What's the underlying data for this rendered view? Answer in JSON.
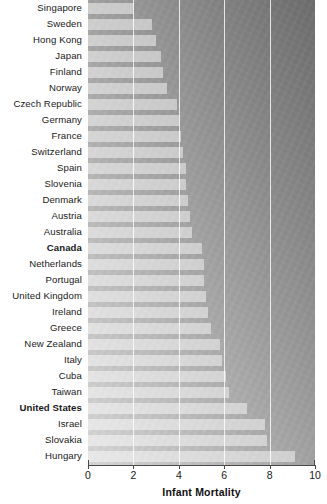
{
  "chart_data": {
    "type": "bar",
    "orientation": "horizontal",
    "title": "",
    "xlabel": "Infant Mortality",
    "ylabel": "",
    "xlim": [
      0,
      10
    ],
    "xticks": [
      0,
      2,
      4,
      6,
      8,
      10
    ],
    "xtick_labels": [
      "0",
      "2",
      "4",
      "6",
      "8",
      "10"
    ],
    "grid": true,
    "gridlines_at": [
      2,
      4,
      6,
      8
    ],
    "legend": "none",
    "categories": [
      "Singapore",
      "Sweden",
      "Hong Kong",
      "Japan",
      "Finland",
      "Norway",
      "Czech Republic",
      "Germany",
      "France",
      "Switzerland",
      "Spain",
      "Slovenia",
      "Denmark",
      "Austria",
      "Australia",
      "Canada",
      "Netherlands",
      "Portugal",
      "United Kingdom",
      "Ireland",
      "Greece",
      "New Zealand",
      "Italy",
      "Cuba",
      "Taiwan",
      "United States",
      "Israel",
      "Slovakia",
      "Hungary"
    ],
    "values": [
      2.0,
      2.8,
      3.0,
      3.2,
      3.3,
      3.5,
      3.9,
      4.0,
      4.1,
      4.2,
      4.3,
      4.3,
      4.4,
      4.5,
      4.6,
      5.0,
      5.1,
      5.1,
      5.2,
      5.3,
      5.4,
      5.8,
      5.9,
      6.1,
      6.2,
      7.0,
      7.8,
      7.9,
      9.1
    ],
    "highlighted_categories": [
      "Canada",
      "United States"
    ]
  },
  "colors": {
    "bar_fill": "#e8e8e8",
    "gridline": "#ffffff",
    "axis": "#4a4a4a",
    "label_text": "#1a1a1a",
    "background_gradient_light": "#d8d8d8",
    "background_gradient_dark": "#6d6d6d"
  }
}
